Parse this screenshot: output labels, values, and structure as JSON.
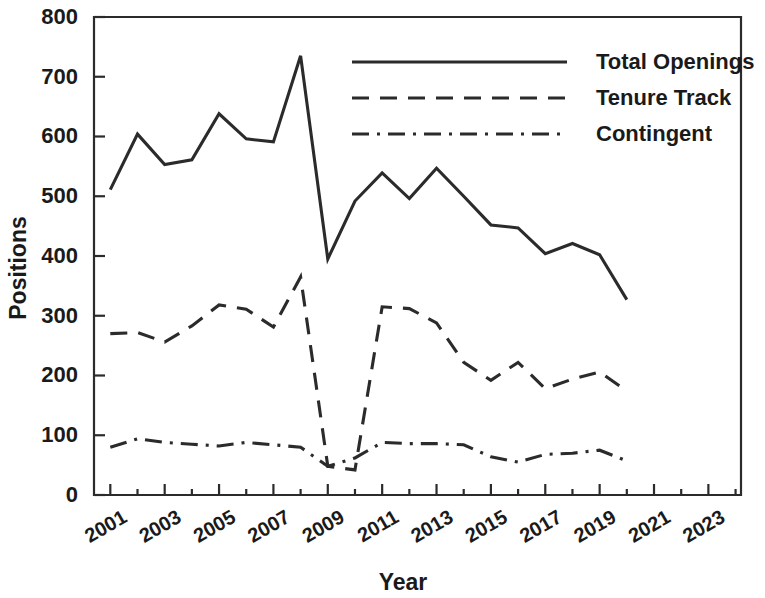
{
  "chart_data": {
    "type": "line",
    "title": "",
    "xlabel": "Year",
    "ylabel": "Positions",
    "xlim": [
      2000.4,
      2024.2
    ],
    "ylim": [
      0,
      800
    ],
    "grid": false,
    "legend_position": "top-right",
    "x_tick_labels": [
      "2001",
      "2003",
      "2005",
      "2007",
      "2009",
      "2011",
      "2013",
      "2015",
      "2017",
      "2019",
      "2021",
      "2023"
    ],
    "x_tick_values": [
      2001,
      2003,
      2005,
      2007,
      2009,
      2011,
      2013,
      2015,
      2017,
      2019,
      2021,
      2023
    ],
    "y_tick_labels": [
      "0",
      "100",
      "200",
      "300",
      "400",
      "500",
      "600",
      "700",
      "800"
    ],
    "y_tick_values": [
      0,
      100,
      200,
      300,
      400,
      500,
      600,
      700,
      800
    ],
    "x": [
      2001,
      2002,
      2003,
      2004,
      2005,
      2006,
      2007,
      2008,
      2009,
      2010,
      2011,
      2012,
      2013,
      2014,
      2015,
      2016,
      2017,
      2018,
      2019,
      2020
    ],
    "series": [
      {
        "name": "Total Openings",
        "style": "solid",
        "color": "#2b2b2b",
        "values": [
          511,
          604,
          553,
          561,
          638,
          596,
          591,
          735,
          395,
          492,
          539,
          496,
          547,
          500,
          452,
          447,
          404,
          421,
          402,
          327
        ]
      },
      {
        "name": "Tenure Track",
        "style": "dashed",
        "color": "#2b2b2b",
        "values": [
          270,
          272,
          256,
          283,
          318,
          311,
          281,
          365,
          48,
          42,
          315,
          312,
          288,
          222,
          192,
          222,
          178,
          194,
          206,
          174
        ]
      },
      {
        "name": "Contingent",
        "style": "dashdot",
        "color": "#2b2b2b",
        "values": [
          80,
          94,
          88,
          85,
          82,
          88,
          84,
          80,
          48,
          62,
          88,
          86,
          86,
          84,
          64,
          55,
          68,
          70,
          75,
          57
        ]
      }
    ]
  },
  "legend": {
    "entries": [
      {
        "label": "Total Openings",
        "style": "solid"
      },
      {
        "label": "Tenure Track",
        "style": "dashed"
      },
      {
        "label": "Contingent",
        "style": "dashdot"
      }
    ]
  },
  "axes": {
    "y_title": "Positions",
    "x_title": "Year"
  }
}
